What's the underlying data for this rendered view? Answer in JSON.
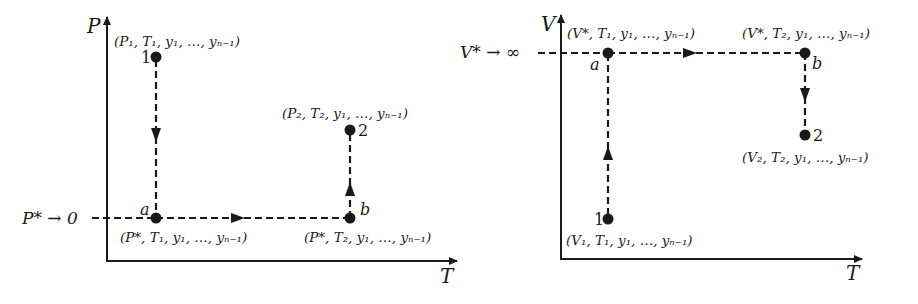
{
  "diagrams": [
    {
      "id": "pressure-path",
      "axes": {
        "y_label": "P",
        "x_label": "T"
      },
      "limit_label": "P* → 0",
      "points": [
        {
          "name": "1",
          "coords": "(P₁, T₁, y₁, …, yₙ₋₁)"
        },
        {
          "name": "a",
          "coords": "(P*, T₁, y₁, …, yₙ₋₁)"
        },
        {
          "name": "b",
          "coords": "(P*, T₂, y₁, …, yₙ₋₁)"
        },
        {
          "name": "2",
          "coords": "(P₂, T₂, y₁, …, yₙ₋₁)"
        }
      ],
      "path": [
        "1",
        "a",
        "b",
        "2"
      ]
    },
    {
      "id": "volume-path",
      "axes": {
        "y_label": "V",
        "x_label": "T"
      },
      "limit_label": "V* → ∞",
      "points": [
        {
          "name": "1",
          "coords": "(V₁, T₁, y₁, …, yₙ₋₁)"
        },
        {
          "name": "a",
          "coords": "(V*, T₁, y₁, …, yₙ₋₁)"
        },
        {
          "name": "b",
          "coords": "(V*, T₂, y₁, …, yₙ₋₁)"
        },
        {
          "name": "2",
          "coords": "(V₂, T₂, y₁, …, yₙ₋₁)"
        }
      ],
      "path": [
        "1",
        "a",
        "b",
        "2"
      ]
    }
  ],
  "colors": {
    "ink": "#1a1a1a",
    "background": "#ffffff"
  }
}
